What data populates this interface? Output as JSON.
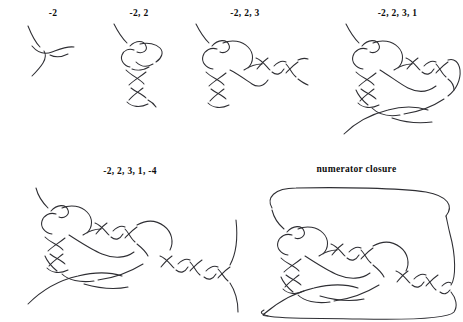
{
  "figure": {
    "background_color": "#ffffff",
    "stroke_color": "#2e2e33",
    "label_color": "#0d0d0d"
  },
  "panels": [
    {
      "id": "panel-1",
      "label": "-2",
      "tangle_vector": [
        -2
      ],
      "description": "single negative two-crossing vertical twist region"
    },
    {
      "id": "panel-2",
      "label": "-2, 2",
      "tangle_vector": [
        -2,
        2
      ],
      "description": "two twist regions stacked vertically"
    },
    {
      "id": "panel-3",
      "label": "-2, 2, 3",
      "tangle_vector": [
        -2,
        2,
        3
      ],
      "description": "adds a horizontal three-crossing twist region on the right"
    },
    {
      "id": "panel-4",
      "label": "-2, 2, 3, 1",
      "tangle_vector": [
        -2,
        2,
        3,
        1
      ],
      "description": "adds a single crossing below"
    },
    {
      "id": "panel-5",
      "label": "-2, 2, 3, 1, -4",
      "tangle_vector": [
        -2,
        2,
        3,
        1,
        -4
      ],
      "description": "adds a four-crossing horizontal twist region on the right"
    },
    {
      "id": "panel-6",
      "label": "numerator closure",
      "tangle_vector": [
        -2,
        2,
        3,
        1,
        -4
      ],
      "description": "the full tangle closed off top and bottom to form a knot"
    }
  ]
}
